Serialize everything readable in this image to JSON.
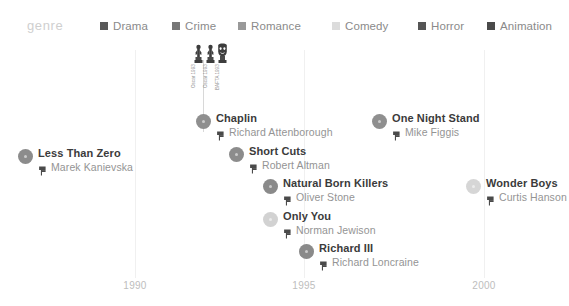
{
  "legend": {
    "title": "genre",
    "items": [
      {
        "label": "Drama",
        "color": "#595959",
        "icon": "square-swatch",
        "x": 100
      },
      {
        "label": "Crime",
        "color": "#777777",
        "icon": "square-swatch",
        "x": 172
      },
      {
        "label": "Romance",
        "color": "#999999",
        "icon": "square-swatch",
        "x": 238
      },
      {
        "label": "Comedy",
        "color": "#dcdcdc",
        "icon": "square-swatch",
        "x": 332
      },
      {
        "label": "Horror",
        "color": "#555555",
        "icon": "square-swatch",
        "x": 418
      },
      {
        "label": "Animation",
        "color": "#4a4a4a",
        "icon": "square-swatch",
        "x": 487
      }
    ]
  },
  "axis": {
    "ticks": [
      {
        "label": "1990",
        "x": 135
      },
      {
        "label": "1995",
        "x": 304
      },
      {
        "label": "2000",
        "x": 484
      }
    ]
  },
  "awards": {
    "stem": {
      "x": 203,
      "top": 18,
      "height": 72
    },
    "items": [
      {
        "name": "oscar-statuette-icon",
        "caption": "Oscar 1993",
        "x": 191
      },
      {
        "name": "oscar-statuette-icon",
        "caption": "Oscar 1993",
        "x": 203
      },
      {
        "name": "bafta-mask-icon",
        "caption": "BAFTA 1993",
        "x": 215
      }
    ]
  },
  "films": [
    {
      "title": "Less Than Zero",
      "director": "Marek Kanievska",
      "color": "#8c8c8c",
      "x": 18,
      "y": 107,
      "icon": "director-chair-icon"
    },
    {
      "title": "Chaplin",
      "director": "Richard Attenborough",
      "color": "#8f8f8f",
      "x": 196,
      "y": 72,
      "icon": "director-chair-icon"
    },
    {
      "title": "Short Cuts",
      "director": "Robert Altman",
      "color": "#8c8c8c",
      "x": 229,
      "y": 105,
      "icon": "director-chair-icon"
    },
    {
      "title": "Natural Born Killers",
      "director": "Oliver Stone",
      "color": "#8a8a8a",
      "x": 263,
      "y": 137,
      "icon": "director-chair-icon"
    },
    {
      "title": "Only You",
      "director": "Norman Jewison",
      "color": "#d2d2d2",
      "x": 263,
      "y": 170,
      "icon": "director-chair-icon"
    },
    {
      "title": "Richard III",
      "director": "Richard Loncraine",
      "color": "#8a8a8a",
      "x": 299,
      "y": 202,
      "icon": "director-chair-icon"
    },
    {
      "title": "One Night Stand",
      "director": "Mike Figgis",
      "color": "#8f8f8f",
      "x": 372,
      "y": 72,
      "icon": "director-chair-icon"
    },
    {
      "title": "Wonder Boys",
      "director": "Curtis Hanson",
      "color": "#d6d6d6",
      "x": 466,
      "y": 137,
      "icon": "director-chair-icon"
    }
  ],
  "chart_data": {
    "type": "scatter",
    "title": "genre",
    "xlabel": "",
    "ylabel": "",
    "xlim": [
      1986.8,
      2001.2
    ],
    "x_ticks": [
      1990,
      1995,
      2000
    ],
    "grid": true,
    "legend_position": "top",
    "legend_entries": [
      "Drama",
      "Crime",
      "Romance",
      "Comedy",
      "Horror",
      "Animation"
    ],
    "points": [
      {
        "label": "Less Than Zero",
        "director": "Marek Kanievska",
        "x": 1987,
        "row": 3,
        "genre": "Crime"
      },
      {
        "label": "Chaplin",
        "director": "Richard Attenborough",
        "x": 1992,
        "row": 2,
        "genre": "Drama",
        "awards": [
          "Oscar 1993",
          "Oscar 1993",
          "BAFTA 1993"
        ]
      },
      {
        "label": "Short Cuts",
        "director": "Robert Altman",
        "x": 1993,
        "row": 3,
        "genre": "Drama"
      },
      {
        "label": "Natural Born Killers",
        "director": "Oliver Stone",
        "x": 1994,
        "row": 4,
        "genre": "Crime"
      },
      {
        "label": "Only You",
        "director": "Norman Jewison",
        "x": 1994,
        "row": 5,
        "genre": "Comedy"
      },
      {
        "label": "Richard III",
        "director": "Richard Loncraine",
        "x": 1995,
        "row": 6,
        "genre": "Drama"
      },
      {
        "label": "One Night Stand",
        "director": "Mike Figgis",
        "x": 1997,
        "row": 2,
        "genre": "Drama"
      },
      {
        "label": "Wonder Boys",
        "director": "Curtis Hanson",
        "x": 2000,
        "row": 4,
        "genre": "Comedy"
      }
    ]
  }
}
